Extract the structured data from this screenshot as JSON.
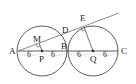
{
  "diagram": {
    "points": {
      "A": {
        "label": "A",
        "x": 18,
        "y": 51
      },
      "P": {
        "label": "P",
        "x": 42,
        "y": 51
      },
      "B": {
        "label": "B",
        "x": 67,
        "y": 51
      },
      "Q": {
        "label": "Q",
        "x": 93,
        "y": 51
      },
      "C": {
        "label": "C",
        "x": 118,
        "y": 51
      },
      "M": {
        "label": "M",
        "x": 39,
        "y": 43
      },
      "D": {
        "label": "D",
        "x": 62,
        "y": 34
      },
      "E": {
        "label": "E",
        "x": 82,
        "y": 27
      }
    },
    "circles": [
      {
        "name": "circle-P",
        "center": "P",
        "r": 25
      },
      {
        "name": "circle-Q",
        "center": "Q",
        "r": 25
      }
    ],
    "segment_lengths": [
      "6",
      "6",
      "6",
      "6"
    ],
    "colors": {
      "stroke": "#333333",
      "dashed": "#888888"
    }
  }
}
